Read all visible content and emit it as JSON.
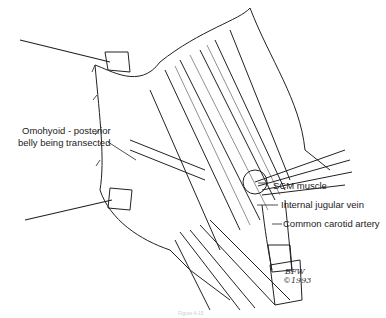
{
  "labels": {
    "omohyoid_line1": "Omohyoid - posterior",
    "omohyoid_line2": "belly being transected",
    "scm": "SCM muscle",
    "ijv": "Internal jugular vein",
    "cca": "Common carotid artery"
  },
  "signature": {
    "initials": "BFW",
    "year": "©1993"
  },
  "caption": "Figure 4-15"
}
